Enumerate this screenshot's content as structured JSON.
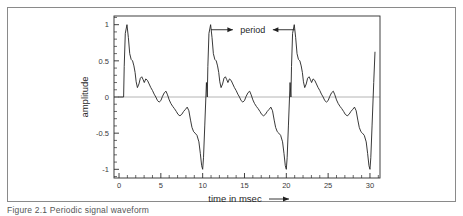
{
  "figure": {
    "caption": "Figure 2.1  Periodic signal waveform",
    "border_color": "#8a8a8a"
  },
  "chart_data": {
    "type": "line",
    "title": "",
    "xlabel": "time in msec",
    "ylabel": "amplitude",
    "xlim": [
      -0.6,
      31.2
    ],
    "ylim": [
      -1.12,
      1.12
    ],
    "grid": false,
    "zero_line": true,
    "zero_line_color": "#b4b4b4",
    "line_color": "#222222",
    "xticks": [
      0,
      5,
      10,
      15,
      20,
      25,
      30
    ],
    "xticklabels": [
      "0",
      "5",
      "10",
      "15",
      "20",
      "25",
      "30"
    ],
    "x_minor_tick_interval": 1,
    "yticks": [
      1,
      0.5,
      0,
      -0.5,
      -1
    ],
    "yticklabels": [
      "1",
      "0.5",
      "0",
      "-0.5",
      "-1"
    ],
    "y_minor_tick_interval": 0.1,
    "period": 10,
    "period_unit": "msec",
    "cycles": 3,
    "series": [
      {
        "name": "waveform",
        "x": [
          0.0,
          0.55,
          0.62,
          0.75,
          0.95,
          1.12,
          1.28,
          1.45,
          1.62,
          1.78,
          1.92,
          2.05,
          2.2,
          2.38,
          2.55,
          2.72,
          2.88,
          3.02,
          3.2,
          3.4,
          3.6,
          3.8,
          4.0,
          4.2,
          4.4,
          4.6,
          4.8,
          5.0,
          5.2,
          5.42,
          5.62,
          5.8,
          6.0,
          6.2,
          6.42,
          6.62,
          6.85,
          7.05,
          7.28,
          7.5,
          7.72,
          7.95,
          8.15,
          8.35,
          8.55,
          8.72,
          8.92,
          9.1,
          9.32,
          9.55,
          9.72,
          9.88,
          10.0,
          10.1,
          10.25,
          10.45
        ],
        "y": [
          0.0,
          0.0,
          0.42,
          0.88,
          1.0,
          0.82,
          0.6,
          0.52,
          0.5,
          0.43,
          0.34,
          0.21,
          0.13,
          0.18,
          0.26,
          0.28,
          0.24,
          0.2,
          0.25,
          0.23,
          0.18,
          0.13,
          0.09,
          0.04,
          0.0,
          -0.05,
          -0.07,
          -0.05,
          0.01,
          0.06,
          0.08,
          0.03,
          -0.04,
          -0.09,
          -0.13,
          -0.16,
          -0.2,
          -0.24,
          -0.26,
          -0.24,
          -0.2,
          -0.17,
          -0.14,
          -0.19,
          -0.32,
          -0.42,
          -0.48,
          -0.5,
          -0.53,
          -0.62,
          -0.78,
          -0.95,
          -1.0,
          -0.84,
          -0.4,
          0.2
        ],
        "note": "One period of the repeating waveform; pattern repeats every 10 msec at x-offsets 0, 10 and 20"
      }
    ],
    "annotations": [
      {
        "name": "period-annotation",
        "text": "period",
        "x_start": 11,
        "x_end": 21,
        "y": 0.93,
        "arrow_style": "outward-double"
      }
    ]
  }
}
